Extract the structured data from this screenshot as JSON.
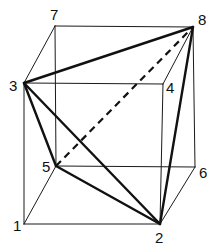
{
  "diagram": {
    "vertices": [
      {
        "id": "1",
        "label": "1",
        "x": 24,
        "y": 224,
        "lx": 13,
        "ly": 231
      },
      {
        "id": "2",
        "label": "2",
        "x": 160,
        "y": 224,
        "lx": 155,
        "ly": 243
      },
      {
        "id": "3",
        "label": "3",
        "x": 24,
        "y": 83,
        "lx": 9,
        "ly": 91
      },
      {
        "id": "4",
        "label": "4",
        "x": 163,
        "y": 84,
        "lx": 166,
        "ly": 93
      },
      {
        "id": "5",
        "label": "5",
        "x": 56,
        "y": 166,
        "lx": 42,
        "ly": 172
      },
      {
        "id": "6",
        "label": "6",
        "x": 195,
        "y": 167,
        "lx": 199,
        "ly": 178
      },
      {
        "id": "7",
        "label": "7",
        "x": 55,
        "y": 26,
        "lx": 50,
        "ly": 20
      },
      {
        "id": "8",
        "label": "8",
        "x": 193,
        "y": 27,
        "lx": 198,
        "ly": 25
      }
    ],
    "cube_edges": [
      [
        "1",
        "2"
      ],
      [
        "2",
        "6"
      ],
      [
        "6",
        "5"
      ],
      [
        "5",
        "1"
      ],
      [
        "3",
        "4"
      ],
      [
        "4",
        "8"
      ],
      [
        "8",
        "7"
      ],
      [
        "7",
        "3"
      ],
      [
        "1",
        "3"
      ],
      [
        "2",
        "4"
      ],
      [
        "6",
        "8"
      ],
      [
        "5",
        "7"
      ]
    ],
    "tetrahedron_edges": [
      [
        "3",
        "8"
      ],
      [
        "3",
        "5"
      ],
      [
        "3",
        "2"
      ],
      [
        "5",
        "2"
      ],
      [
        "8",
        "2"
      ]
    ],
    "hidden_edges": [
      [
        "5",
        "8"
      ]
    ],
    "colors": {
      "line": "#111111",
      "background": "#ffffff"
    }
  }
}
